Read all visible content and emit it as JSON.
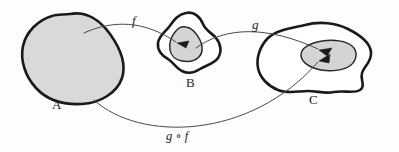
{
  "figure": {
    "type": "function-composition-diagram",
    "background_color": "#fdfdfd",
    "outline_color": "#1a1a1a",
    "fill_color": "#d9d9d9",
    "arrow_color": "#4a4a4a"
  },
  "sets": [
    {
      "id": "A",
      "label": "A",
      "label_x": 52,
      "label_y": 98,
      "filled": true,
      "has_image_region": false
    },
    {
      "id": "B",
      "label": "B",
      "label_x": 186,
      "label_y": 76,
      "filled": false,
      "has_image_region": true
    },
    {
      "id": "C",
      "label": "C",
      "label_x": 309,
      "label_y": 93,
      "filled": false,
      "has_image_region": true
    }
  ],
  "maps": [
    {
      "id": "f",
      "label": "f",
      "from": "A",
      "to": "B",
      "label_x": 132,
      "label_y": 14
    },
    {
      "id": "g",
      "label": "g",
      "from": "B",
      "to": "C",
      "label_x": 252,
      "label_y": 18
    },
    {
      "id": "gof",
      "label": "g ∘ f",
      "from": "A",
      "to": "C",
      "label_x": 166,
      "label_y": 130
    }
  ]
}
